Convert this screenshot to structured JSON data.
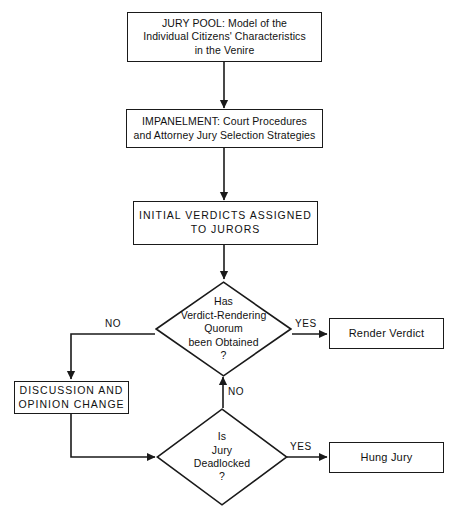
{
  "diagram": {
    "colors": {
      "stroke": "#1a1a1a",
      "background": "#ffffff",
      "text": "#111111"
    },
    "nodes": {
      "jury_pool": {
        "shape": "rectangle",
        "text": "JURY POOL:  Model of the\nIndividual Citizens' Characteristics\nin the Venire"
      },
      "impanelment": {
        "shape": "rectangle",
        "text": "IMPANELMENT:  Court Procedures\nand Attorney Jury Selection Strategies"
      },
      "initial_verdicts": {
        "shape": "rectangle",
        "text": "INITIAL  VERDICTS  ASSIGNED\nTO  JURORS"
      },
      "quorum_decision": {
        "shape": "diamond",
        "text": "Has\nVerdict-Rendering\nQuorum\nbeen Obtained\n?"
      },
      "render_verdict": {
        "shape": "rectangle",
        "text": "Render Verdict"
      },
      "discussion": {
        "shape": "rectangle",
        "text": "DISCUSSION  AND\nOPINION  CHANGE"
      },
      "deadlock_decision": {
        "shape": "diamond",
        "text": "Is\nJury\nDeadlocked\n?"
      },
      "hung_jury": {
        "shape": "rectangle",
        "text": "Hung Jury"
      }
    },
    "edge_labels": {
      "quorum_yes": "YES",
      "quorum_no": "NO",
      "deadlock_yes": "YES",
      "deadlock_no": "NO"
    }
  }
}
